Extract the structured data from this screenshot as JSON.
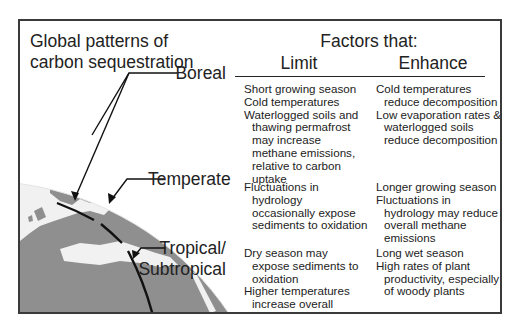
{
  "title": "Global patterns of\ncarbon sequestration",
  "title_lines": [
    "Global patterns of",
    "carbon sequestration"
  ],
  "factors_heading": "Factors that:",
  "columns": {
    "limit": "Limit",
    "enhance": "Enhance"
  },
  "zones": [
    {
      "name": "Boreal",
      "limit": [
        "Short growing season",
        "Cold temperatures",
        "Waterlogged soils and thawing permafrost may increase methane emissions, relative to carbon uptake"
      ],
      "enhance": [
        "Cold temperatures reduce decomposition",
        "Low evaporation rates & waterlogged soils reduce decomposition"
      ]
    },
    {
      "name": "Temperate",
      "limit": [
        "Fluctuations in hydrology occasionally expose sediments to oxidation"
      ],
      "enhance": [
        "Longer growing season",
        "Fluctuations in hydrology may reduce overall methane emissions"
      ]
    },
    {
      "name_lines": [
        "Tropical/",
        "Subtropical"
      ],
      "name": "Tropical/ Subtropical",
      "limit": [
        "Dry season may expose sediments to oxidation",
        "Higher temperatures increase overall methane emissions"
      ],
      "enhance": [
        "Long wet season",
        "High rates of plant productivity, especially of woody plants"
      ]
    }
  ],
  "colors": {
    "land": "#8f8f8f",
    "ocean": "#f2f2f2",
    "line": "#1a1a1a",
    "frame": "#3a3a3a"
  }
}
